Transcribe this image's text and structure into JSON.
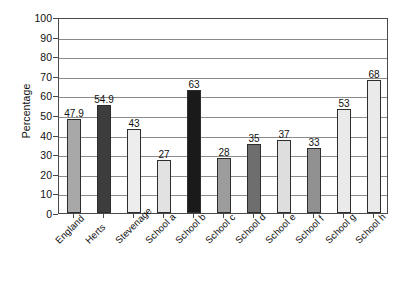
{
  "chart_data": {
    "type": "bar",
    "title": "",
    "subtitle": "",
    "xlabel": "",
    "ylabel": "Percentage",
    "ylim": [
      0,
      100
    ],
    "ytick_step": 10,
    "yticks": [
      0,
      10,
      20,
      30,
      40,
      50,
      60,
      70,
      80,
      90,
      100
    ],
    "grid": true,
    "legend": "none",
    "categories": [
      "England",
      "Herts",
      "Stevenage",
      "School a",
      "School b",
      "School c",
      "School d",
      "School e",
      "School f",
      "School g",
      "School h"
    ],
    "values": [
      47.9,
      54.9,
      43,
      27,
      63,
      28,
      35,
      37,
      33,
      53,
      68
    ],
    "value_labels": [
      "47.9",
      "54.9",
      "43",
      "27",
      "63",
      "28",
      "35",
      "37",
      "33",
      "53",
      "68"
    ],
    "bar_colors": [
      "#a8a8a8",
      "#3d3d3d",
      "#ededed",
      "#e2e2e2",
      "#1a1a1a",
      "#9c9c9c",
      "#6e6e6e",
      "#dedede",
      "#919191",
      "#eaeaea",
      "#eaeaea"
    ]
  },
  "axes": {
    "frame_color": "#4a4a4a",
    "gridline_color": "#8a8a8a",
    "background": "#ffffff",
    "text_color": "#111111"
  }
}
